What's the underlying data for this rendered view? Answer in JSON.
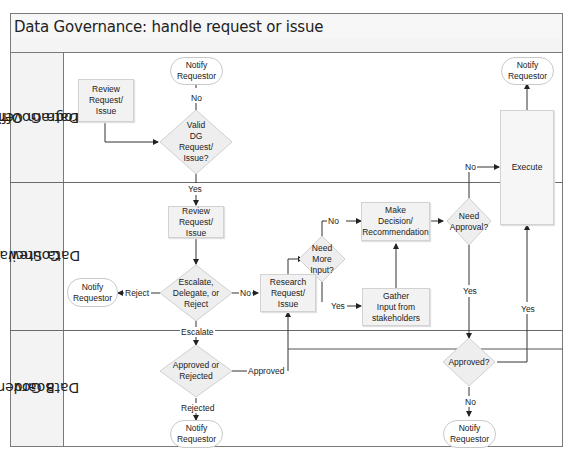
{
  "title": "Data Governance: handle request or issue",
  "lanes": [
    {
      "id": "program-office",
      "label_line1": "Data Governance",
      "label_line2": "Program Office"
    },
    {
      "id": "stewardship-council",
      "label_line1": "Data Stewardship",
      "label_line2": "Council"
    },
    {
      "id": "governance-board",
      "label_line1": "Data Governance",
      "label_line2": "Board"
    }
  ],
  "nodes": {
    "po_review": {
      "type": "process",
      "lines": [
        "Review",
        "Request/",
        "Issue"
      ]
    },
    "po_valid": {
      "type": "decision",
      "lines": [
        "Valid",
        "DG",
        "Request/",
        "Issue?"
      ]
    },
    "po_notify": {
      "type": "terminal",
      "lines": [
        "Notify",
        "Requestor"
      ]
    },
    "execute": {
      "type": "process",
      "lines": [
        "Execute"
      ]
    },
    "execute_notify": {
      "type": "terminal",
      "lines": [
        "Notify",
        "Requestor"
      ]
    },
    "sc_review": {
      "type": "process",
      "lines": [
        "Review",
        "Request/",
        "Issue"
      ]
    },
    "sc_escalate": {
      "type": "decision",
      "lines": [
        "Escalate,",
        "Delegate, or",
        "Reject"
      ]
    },
    "sc_notify": {
      "type": "terminal",
      "lines": [
        "Notify",
        "Requestor"
      ]
    },
    "sc_research": {
      "type": "process",
      "lines": [
        "Research",
        "Request/",
        "Issue"
      ]
    },
    "sc_more_input": {
      "type": "decision",
      "lines": [
        "Need",
        "More",
        "Input?"
      ]
    },
    "sc_decision": {
      "type": "process",
      "lines": [
        "Make",
        "Decision/",
        "Recommendation"
      ]
    },
    "sc_gather": {
      "type": "process",
      "lines": [
        "Gather",
        "Input from",
        "stakeholders"
      ]
    },
    "sc_need_approval": {
      "type": "decision",
      "lines": [
        "Need",
        "Approval?"
      ]
    },
    "b_approved_rejected": {
      "type": "decision",
      "lines": [
        "Approved or",
        "Rejected"
      ]
    },
    "b_notify_rejected": {
      "type": "terminal",
      "lines": [
        "Notify",
        "Requestor"
      ]
    },
    "b_approved": {
      "type": "decision",
      "lines": [
        "Approved?"
      ]
    },
    "b_notify_no": {
      "type": "terminal",
      "lines": [
        "Notify",
        "Requestor"
      ]
    }
  },
  "edge_labels": {
    "valid_no": "No",
    "valid_yes": "Yes",
    "escalate_reject": "Reject",
    "escalate_no": "No",
    "escalate_escalate": "Escalate",
    "more_input_no": "No",
    "more_input_yes": "Yes",
    "need_approval_no": "No",
    "need_approval_yes": "Yes",
    "approved_yes": "Yes",
    "approved_no": "No",
    "board_approved": "Approved",
    "board_rejected": "Rejected"
  },
  "colors": {
    "process_fill": "#f2f2f2",
    "decision_fill": "#eeeeee",
    "border": "#7a7a7a",
    "line": "#333333"
  }
}
